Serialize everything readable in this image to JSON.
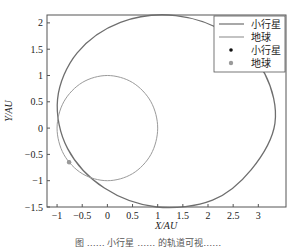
{
  "chart_data": {
    "type": "line",
    "title": "",
    "xlabel": "X/AU",
    "ylabel": "Y/AU",
    "xlim": [
      -1.2,
      3.55
    ],
    "ylim": [
      -1.5,
      2.15
    ],
    "xticks": [
      -1,
      -0.5,
      0,
      0.5,
      1,
      1.5,
      2,
      2.5,
      3
    ],
    "xtick_labels": [
      "−1",
      "−0.5",
      "0",
      "0.5",
      "1",
      "1.5",
      "2",
      "2.5",
      "3"
    ],
    "yticks": [
      -1.5,
      -1,
      -0.5,
      0,
      0.5,
      1,
      1.5,
      2
    ],
    "ytick_labels": [
      "−1.5",
      "−1",
      "−0.5",
      "0",
      "0.5",
      "1",
      "1.5",
      "2"
    ],
    "grid": false,
    "legend_position": "top-right",
    "series": [
      {
        "name": "小行星",
        "kind": "orbit",
        "color": "#6e6e6e",
        "x": [
          3.33,
          3.13,
          2.42,
          1.36,
          0.26,
          -0.6,
          -0.99,
          -0.79,
          -0.06,
          0.98,
          2.09,
          2.86,
          3.33
        ],
        "y": [
          0.09,
          1.03,
          1.78,
          2.14,
          2.01,
          1.43,
          0.55,
          -0.39,
          -1.14,
          -1.5,
          -1.37,
          -0.79,
          0.09
        ]
      },
      {
        "name": "地球",
        "kind": "orbit",
        "color": "#9a9a9a",
        "x": [
          1,
          0.866,
          0.5,
          0,
          -0.5,
          -0.866,
          -1,
          -0.866,
          -0.5,
          0,
          0.5,
          0.866,
          1
        ],
        "y": [
          0,
          0.5,
          0.866,
          1,
          0.866,
          0.5,
          0,
          -0.5,
          -0.866,
          -1,
          -0.866,
          -0.5,
          0
        ]
      }
    ],
    "points": [
      {
        "name": "小行星",
        "x": -0.76,
        "y": -0.65,
        "color": "#111111"
      },
      {
        "name": "地球",
        "x": -0.76,
        "y": -0.65,
        "color": "#9a9a9a"
      }
    ],
    "legend": [
      {
        "label": "小行星",
        "type": "line",
        "color": "#6e6e6e"
      },
      {
        "label": "地球",
        "type": "line",
        "color": "#9a9a9a"
      },
      {
        "label": "小行星",
        "type": "dot",
        "color": "#111111"
      },
      {
        "label": "地球",
        "type": "dot",
        "color": "#9a9a9a"
      }
    ]
  },
  "caption": "图 …… 小行星 …… 的轨道可视……"
}
